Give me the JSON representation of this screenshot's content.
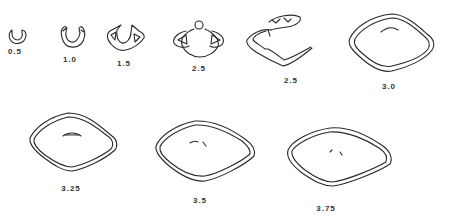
{
  "figure": {
    "stages": [
      {
        "id": "s1",
        "label": "0.5",
        "x": 15,
        "y": 52
      },
      {
        "id": "s2",
        "label": "1.0",
        "x": 70,
        "y": 58
      },
      {
        "id": "s3",
        "label": "1.5",
        "x": 124,
        "y": 62
      },
      {
        "id": "s4",
        "label": "2.5",
        "x": 199,
        "y": 66
      },
      {
        "id": "s5",
        "label": "2.5",
        "x": 291,
        "y": 78
      },
      {
        "id": "s6",
        "label": "3.0",
        "x": 389,
        "y": 84
      },
      {
        "id": "s7",
        "label": "3.25",
        "x": 71,
        "y": 187
      },
      {
        "id": "s8",
        "label": "3.5",
        "x": 200,
        "y": 198
      },
      {
        "id": "s9",
        "label": "3.75",
        "x": 326,
        "y": 206
      }
    ],
    "colors": {
      "line": "#2a2a2a",
      "label": "#333333",
      "background": "#ffffff"
    }
  }
}
